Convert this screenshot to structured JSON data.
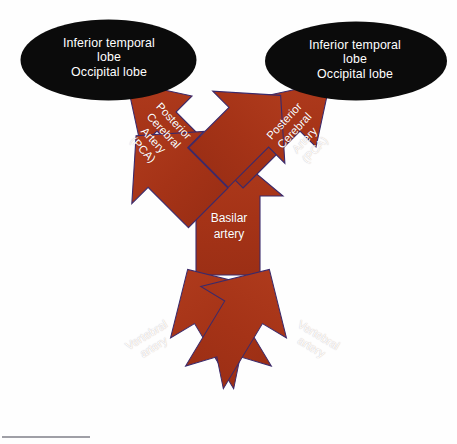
{
  "diagram": {
    "background_color": "#ffffff",
    "vessel_color": "#A83419",
    "vessel_outline_color": "#3b2a6b",
    "callout_fill_color": "#0b0b0b",
    "label_text_color": "#ffffff"
  },
  "callouts": [
    {
      "id": "inferior-temporal-occipital-left",
      "text": "Inferior temporal\nlobe\nOccipital lobe",
      "shape": "ellipse",
      "side": "left"
    },
    {
      "id": "inferior-temporal-occipital-right",
      "text": "Inferior temporal\nlobe\nOccipital lobe",
      "shape": "ellipse",
      "side": "right"
    }
  ],
  "vessels": [
    {
      "id": "posterior-cerebral-artery-left",
      "text": "Posterior\nCerebral\nArtery\n(PCA)",
      "direction": "up-left",
      "rotation_deg": 47
    },
    {
      "id": "posterior-cerebral-artery-right",
      "text": "Posterior\nCerebral\nArtery\n(PCA)",
      "direction": "up-right",
      "rotation_deg": -47
    },
    {
      "id": "basilar-artery",
      "text": "Basilar\nartery",
      "direction": "up",
      "rotation_deg": 0
    },
    {
      "id": "vertebral-artery-left",
      "text": "Vertebral\nartery",
      "direction": "up-right",
      "rotation_deg": -31
    },
    {
      "id": "vertebral-artery-right",
      "text": "Vertebral\nartery",
      "direction": "up-left",
      "rotation_deg": 31
    }
  ]
}
